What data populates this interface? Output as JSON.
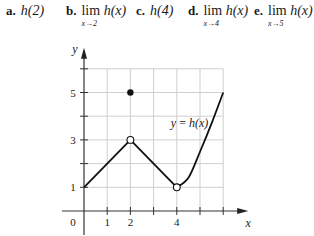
{
  "questions": [
    {
      "label": "a.",
      "type": "value",
      "text": "h(2)"
    },
    {
      "label": "b.",
      "type": "limit",
      "func": "h(x)",
      "sub": "x→2"
    },
    {
      "label": "c.",
      "type": "value",
      "text": "h(4)"
    },
    {
      "label": "d.",
      "type": "limit",
      "func": "h(x)",
      "sub": "x→4"
    },
    {
      "label": "e.",
      "type": "limit",
      "func": "h(x)",
      "sub": "x→5"
    }
  ],
  "lim_word": "lim",
  "chart_data": {
    "type": "line",
    "title": "",
    "curve_label": "y = h(x)",
    "xlabel": "x",
    "ylabel": "y",
    "xlim": [
      0,
      6
    ],
    "ylim": [
      0,
      6
    ],
    "grid": true,
    "x_tick_labels": [
      {
        "value": 0,
        "label": "0"
      },
      {
        "value": 1,
        "label": "1"
      },
      {
        "value": 2,
        "label": "2"
      },
      {
        "value": 4,
        "label": "4"
      }
    ],
    "y_tick_labels": [
      {
        "value": 1,
        "label": "1"
      },
      {
        "value": 3,
        "label": "3"
      },
      {
        "value": 5,
        "label": "5"
      }
    ],
    "series": [
      {
        "name": "segment-left",
        "kind": "line",
        "points": [
          [
            0,
            1
          ],
          [
            2,
            3
          ]
        ]
      },
      {
        "name": "segment-middle",
        "kind": "line",
        "points": [
          [
            2,
            3
          ],
          [
            4,
            1
          ]
        ]
      },
      {
        "name": "curve-right",
        "kind": "curve",
        "points": [
          [
            4,
            1
          ],
          [
            4.5,
            1.4
          ],
          [
            5,
            2.5
          ],
          [
            5.5,
            3.7
          ],
          [
            6,
            5
          ]
        ]
      }
    ],
    "points": [
      {
        "x": 2,
        "y": 5,
        "style": "filled"
      },
      {
        "x": 2,
        "y": 3,
        "style": "open"
      },
      {
        "x": 4,
        "y": 1,
        "style": "open"
      }
    ]
  }
}
